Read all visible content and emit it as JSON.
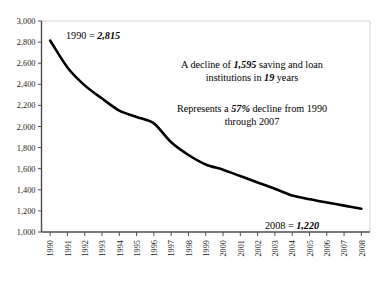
{
  "chart_data": {
    "type": "line",
    "title": "",
    "subtitle": "",
    "xlabel": "",
    "ylabel": "",
    "ylim": [
      1000,
      3000
    ],
    "grid": false,
    "legend": "none",
    "categories": [
      "1990",
      "1991",
      "1992",
      "1993",
      "1994",
      "1995",
      "1996",
      "1997",
      "1998",
      "1999",
      "2000",
      "2001",
      "2002",
      "2003",
      "2004",
      "2005",
      "2006",
      "2007",
      "2008"
    ],
    "yticks": [
      "3,000",
      "2,800",
      "2,600",
      "2,400",
      "2,200",
      "2,000",
      "1,800",
      "1,600",
      "1,400",
      "1,200",
      "1,000"
    ],
    "ytick_values": [
      3000,
      2800,
      2600,
      2400,
      2200,
      2000,
      1800,
      1600,
      1400,
      1200,
      1000
    ],
    "series": [
      {
        "name": "Saving and loan institutions",
        "values": [
          2815,
          2560,
          2390,
          2265,
          2150,
          2090,
          2030,
          1850,
          1730,
          1640,
          1590,
          1530,
          1470,
          1410,
          1345,
          1310,
          1280,
          1250,
          1220
        ]
      }
    ],
    "annotations": [
      {
        "id": "start-value",
        "segments": [
          {
            "text": "1990 = ",
            "emphasis": false
          },
          {
            "text": "2,815",
            "emphasis": true
          }
        ]
      },
      {
        "id": "decline-note",
        "lines": [
          [
            {
              "text": "A decline of ",
              "emphasis": false
            },
            {
              "text": "1,595",
              "emphasis": true
            },
            {
              "text": " saving and loan",
              "emphasis": false
            }
          ],
          [
            {
              "text": "institutions in ",
              "emphasis": false
            },
            {
              "text": "19",
              "emphasis": true
            },
            {
              "text": " years",
              "emphasis": false
            }
          ]
        ]
      },
      {
        "id": "percent-note",
        "lines": [
          [
            {
              "text": "Represents a ",
              "emphasis": false
            },
            {
              "text": "57%",
              "emphasis": true
            },
            {
              "text": " decline from 1990",
              "emphasis": false
            }
          ],
          [
            {
              "text": "through 2007",
              "emphasis": false
            }
          ]
        ]
      },
      {
        "id": "end-value",
        "segments": [
          {
            "text": "2008 = ",
            "emphasis": false
          },
          {
            "text": "1,220",
            "emphasis": true
          }
        ]
      }
    ],
    "colors": {
      "line": "#000000",
      "axis": "#4d4d4d",
      "frame": "#d4d4d4",
      "background": "#ffffff",
      "text": "#000000"
    }
  }
}
